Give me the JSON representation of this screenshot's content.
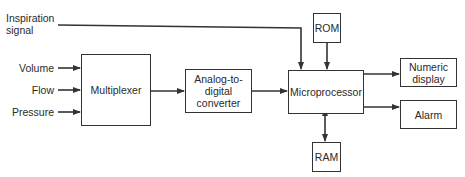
{
  "diagram": {
    "inputs": {
      "inspiration": "Inspiration\nsignal",
      "volume": "Volume",
      "flow": "Flow",
      "pressure": "Pressure"
    },
    "blocks": {
      "multiplexer": "Multiplexer",
      "adc": "Analog-to-\ndigital\nconverter",
      "microprocessor": "Microprocessor",
      "rom": "ROM",
      "ram": "RAM",
      "numeric_display": "Numeric\ndisplay",
      "alarm": "Alarm"
    },
    "connections": [
      {
        "from": "Inspiration signal",
        "to": "Microprocessor"
      },
      {
        "from": "Volume",
        "to": "Multiplexer"
      },
      {
        "from": "Flow",
        "to": "Multiplexer"
      },
      {
        "from": "Pressure",
        "to": "Multiplexer"
      },
      {
        "from": "Multiplexer",
        "to": "Analog-to-digital converter"
      },
      {
        "from": "Analog-to-digital converter",
        "to": "Microprocessor"
      },
      {
        "from": "ROM",
        "to": "Microprocessor"
      },
      {
        "from": "Microprocessor",
        "to": "RAM",
        "bidirectional": true
      },
      {
        "from": "Microprocessor",
        "to": "Numeric display"
      },
      {
        "from": "Microprocessor",
        "to": "Alarm"
      }
    ],
    "colors": {
      "line": "#333333",
      "text": "#2a2a2a",
      "background": "#ffffff"
    }
  }
}
